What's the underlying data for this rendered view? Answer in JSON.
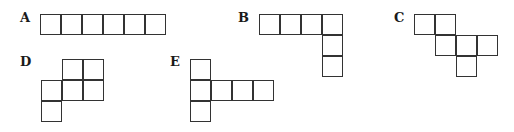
{
  "figure": {
    "cell_size": 21,
    "stroke_color": "#333333",
    "shapes": [
      {
        "label": "A",
        "label_pos": [
          20,
          11
        ],
        "origin": [
          40,
          14
        ],
        "cells": [
          [
            0,
            0
          ],
          [
            1,
            0
          ],
          [
            2,
            0
          ],
          [
            3,
            0
          ],
          [
            4,
            0
          ],
          [
            5,
            0
          ]
        ]
      },
      {
        "label": "B",
        "label_pos": [
          238,
          11
        ],
        "origin": [
          259,
          14
        ],
        "cells": [
          [
            0,
            0
          ],
          [
            1,
            0
          ],
          [
            2,
            0
          ],
          [
            3,
            0
          ],
          [
            3,
            1
          ],
          [
            3,
            2
          ]
        ]
      },
      {
        "label": "C",
        "label_pos": [
          394,
          11
        ],
        "origin": [
          414,
          14
        ],
        "cells": [
          [
            0,
            0
          ],
          [
            1,
            0
          ],
          [
            1,
            1
          ],
          [
            2,
            1
          ],
          [
            3,
            1
          ],
          [
            2,
            2
          ]
        ]
      },
      {
        "label": "D",
        "label_pos": [
          20,
          55
        ],
        "origin": [
          41,
          59
        ],
        "cells": [
          [
            1,
            0
          ],
          [
            2,
            0
          ],
          [
            0,
            1
          ],
          [
            1,
            1
          ],
          [
            2,
            1
          ],
          [
            0,
            2
          ]
        ]
      },
      {
        "label": "E",
        "label_pos": [
          170,
          55
        ],
        "origin": [
          190,
          59
        ],
        "cells": [
          [
            0,
            0
          ],
          [
            0,
            1
          ],
          [
            1,
            1
          ],
          [
            2,
            1
          ],
          [
            3,
            1
          ],
          [
            0,
            2
          ]
        ]
      }
    ]
  }
}
